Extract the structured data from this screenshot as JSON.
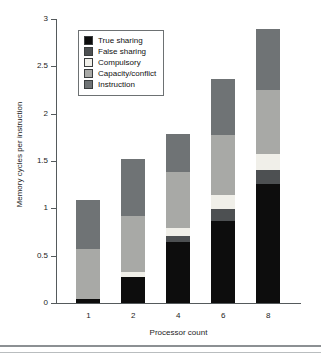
{
  "chart_data": {
    "type": "bar",
    "stacked": true,
    "title": "",
    "subtitle": "",
    "xlabel": "Processor count",
    "ylabel": "Memory cycles per instruction",
    "categories": [
      "1",
      "2",
      "4",
      "6",
      "8"
    ],
    "ylim": [
      0,
      3
    ],
    "ytick_labels": [
      "0",
      "0.5",
      "1",
      "1.5",
      "2",
      "2.5",
      "3"
    ],
    "ytick_values": [
      0,
      0.5,
      1,
      1.5,
      2,
      2.5,
      3
    ],
    "grid": false,
    "legend_position": "upper-left-inside",
    "series": [
      {
        "name": "True sharing",
        "color": "#0d0d0d",
        "values": [
          0.04,
          0.27,
          0.64,
          0.87,
          1.26
        ]
      },
      {
        "name": "False sharing",
        "color": "#4d5052",
        "values": [
          0.0,
          0.01,
          0.07,
          0.12,
          0.14
        ]
      },
      {
        "name": "Compulsory",
        "color": "#f0efe9",
        "values": [
          0.0,
          0.05,
          0.08,
          0.15,
          0.17
        ]
      },
      {
        "name": "Capacity/conflict",
        "color": "#a8a9a6",
        "values": [
          0.53,
          0.59,
          0.59,
          0.64,
          0.68
        ]
      },
      {
        "name": "Instruction",
        "color": "#6f7375",
        "values": [
          0.52,
          0.6,
          0.41,
          0.59,
          0.64
        ]
      }
    ],
    "totals": [
      1.09,
      1.52,
      1.79,
      2.37,
      2.89
    ]
  },
  "legend": {
    "items": [
      {
        "label": "True sharing"
      },
      {
        "label": "False sharing"
      },
      {
        "label": "Compulsory"
      },
      {
        "label": "Capacity/conflict"
      },
      {
        "label": "Instruction"
      }
    ]
  },
  "axes": {
    "x_title": "Processor count",
    "y_title": "Memory cycles per instruction"
  }
}
